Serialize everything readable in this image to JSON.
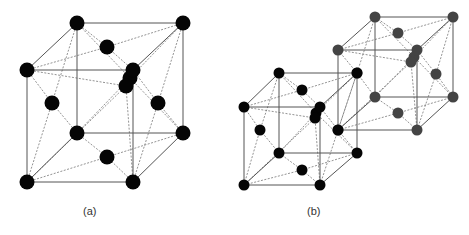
{
  "figure": {
    "width": 469,
    "height": 235,
    "labels": [
      {
        "text": "(a)",
        "x": 83,
        "y": 205
      },
      {
        "text": "(b)",
        "x": 307,
        "y": 205
      }
    ],
    "colors": {
      "black_atom": "#050505",
      "gray_atom": "#444444",
      "solid_edge": "#555555",
      "dashed_edge": "#777777"
    },
    "cubes": [
      {
        "name": "cube-a",
        "color": "black",
        "radius": 7.5,
        "corners": [
          [
            77,
            23
          ],
          [
            183,
            23
          ],
          [
            27,
            70
          ],
          [
            133,
            70
          ],
          [
            77,
            133
          ],
          [
            183,
            133
          ],
          [
            27,
            182
          ],
          [
            133,
            182
          ]
        ],
        "faces": {
          "top": [
            107,
            47
          ],
          "front": [
            126,
            86
          ],
          "left": [
            52,
            103
          ],
          "right": [
            158,
            103
          ],
          "bottom": [
            107,
            157
          ],
          "back": [
            130,
            78
          ]
        }
      },
      {
        "name": "cube-b-gray",
        "color": "gray",
        "radius": 5.5,
        "corners": [
          [
            375,
            17
          ],
          [
            453,
            17
          ],
          [
            338,
            50
          ],
          [
            417,
            50
          ],
          [
            375,
            97
          ],
          [
            453,
            97
          ],
          [
            338,
            130
          ],
          [
            417,
            130
          ]
        ],
        "faces": {
          "top": [
            398,
            33
          ],
          "front": [
            411,
            62
          ],
          "left": [
            357,
            73
          ],
          "right": [
            436,
            74
          ],
          "bottom": [
            398,
            113
          ],
          "back": [
            414,
            57
          ]
        }
      },
      {
        "name": "cube-b-black",
        "color": "black",
        "radius": 5.5,
        "corners": [
          [
            279,
            73
          ],
          [
            357,
            73
          ],
          [
            244,
            107
          ],
          [
            320,
            107
          ],
          [
            279,
            153
          ],
          [
            357,
            153
          ],
          [
            244,
            185
          ],
          [
            320,
            185
          ]
        ],
        "faces": {
          "top": [
            302,
            90
          ],
          "front": [
            315,
            118
          ],
          "left": [
            260,
            130
          ],
          "right": [
            338,
            130
          ],
          "bottom": [
            302,
            170
          ],
          "back": [
            316,
            113
          ]
        }
      }
    ]
  }
}
